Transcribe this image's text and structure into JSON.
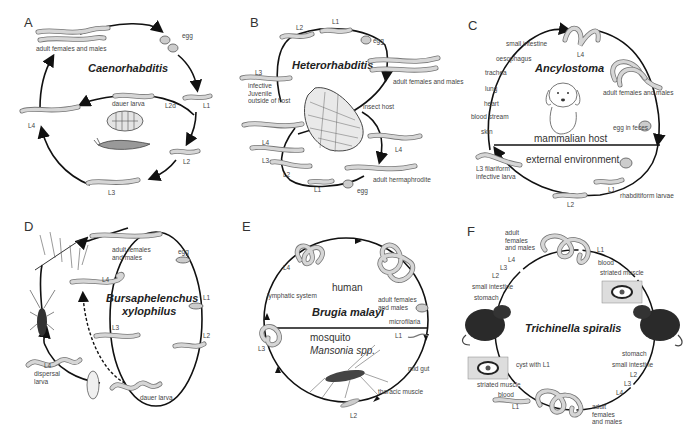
{
  "figure": {
    "panels": [
      {
        "id": "A",
        "letter": "A",
        "organism": "Caenorhabditis",
        "stages": [
          "adult females and males",
          "egg",
          "L1",
          "L2d",
          "dauer larva",
          "L2",
          "L3",
          "L4"
        ],
        "host": "",
        "labels": {
          "adults": "adult females and males",
          "egg": "egg",
          "l1": "L1",
          "l2d": "L2d",
          "dauer": "dauer larva",
          "l2": "L2",
          "l3": "L3",
          "l4": "L4"
        }
      },
      {
        "id": "B",
        "letter": "B",
        "organism": "Heterorhabditis",
        "labels": {
          "l1_top": "L1",
          "l2_top": "L2",
          "egg_top": "egg",
          "adults": "adult females and males",
          "l3": "L3",
          "ij": "infective Juvenile outside of host",
          "host": "insect host",
          "l4_left": "L4",
          "l3_left": "L3",
          "l2_bottom": "L2",
          "l1_bottom": "L1",
          "egg_bottom": "egg",
          "l4_right": "L4",
          "herm": "adult hermaphrodite"
        }
      },
      {
        "id": "C",
        "letter": "C",
        "organism": "Ancylostoma",
        "labels": {
          "small_intestine": "small intestine",
          "oesophagus": "oesophagus",
          "trachea": "trachea",
          "lung": "lung",
          "heart": "heart",
          "blood": "blood stream",
          "skin": "skin",
          "l4": "L4",
          "adults": "adult females and males",
          "egg": "egg in feces",
          "host": "mammalian host",
          "env": "external environment",
          "l3": "L3 filariform infective larva",
          "l2": "L2",
          "l1": "L1",
          "rhab": "rhabditiform larvae"
        }
      },
      {
        "id": "D",
        "letter": "D",
        "organism_line1": "Bursaphelenchus",
        "organism_line2": "xylophilus",
        "labels": {
          "adults": "adult females and males",
          "egg": "egg",
          "l4": "L4",
          "l1": "L1",
          "l3": "L3",
          "l2": "L2",
          "l4_dispersal": "L4",
          "dispersal": "dispersal larva",
          "dauer": "dauer larva"
        }
      },
      {
        "id": "E",
        "letter": "E",
        "organism": "Brugia malayi",
        "labels": {
          "human": "human",
          "l4": "L4",
          "lymph": "lymphatic system",
          "adults": "adult females and males",
          "micro": "microfilaria",
          "l1": "L1",
          "mosquito": "mosquito",
          "mansonia": "Mansonia spp.",
          "l3": "L3",
          "midgut": "mid gut",
          "thoracic": "thoracic muscle",
          "l2": "L2"
        }
      },
      {
        "id": "F",
        "letter": "F",
        "organism": "Trichinella spiralis",
        "labels": {
          "adults_top": "adult females and males",
          "l4_top": "L4",
          "l3_top": "L3",
          "l2_top": "L2",
          "si_top": "small intestine",
          "stomach_top": "stomach",
          "l1_top": "L1",
          "blood_top": "blood",
          "muscle_top": "striated muscle",
          "stomach_right": "stomach",
          "si_right": "small intestine",
          "l2_right": "L2",
          "l3_right": "L3",
          "l4_right": "L4",
          "adults_bottom": "adult females and males",
          "cyst": "cyst with L1",
          "muscle_bottom": "striated muscle",
          "blood_bottom": "blood",
          "l1_bottom": "L1"
        }
      }
    ]
  }
}
